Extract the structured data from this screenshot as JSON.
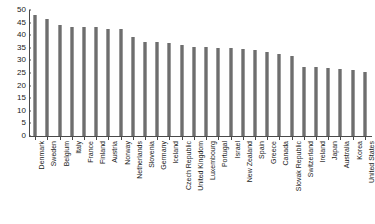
{
  "chart_data": {
    "type": "bar",
    "title": "",
    "subtitle": "",
    "xlabel": "",
    "ylabel": "",
    "ylim": [
      0,
      50
    ],
    "yticks": [
      0,
      5,
      10,
      15,
      20,
      25,
      30,
      35,
      40,
      45,
      50
    ],
    "grid": false,
    "legend": null,
    "bar_color": "#6e6e6e",
    "axis_color": "#4a4a4a",
    "categories": [
      "Denmark",
      "Sweden",
      "Belgium",
      "Italy",
      "France",
      "Finland",
      "Austria",
      "Norway",
      "Netherlands",
      "Slovenia",
      "Germany",
      "Iceland",
      "Czech Republic",
      "United Kingdom",
      "Luxembourg",
      "Portugal",
      "Israel",
      "New Zealand",
      "Spain",
      "Greece",
      "Canada",
      "Slovak Republic",
      "Switzerland",
      "Ireland",
      "Japan",
      "Australia",
      "Korea",
      "United States"
    ],
    "values": [
      48.0,
      46.5,
      44.0,
      43.2,
      43.2,
      43.2,
      42.6,
      42.6,
      39.1,
      37.2,
      37.2,
      37.1,
      36.2,
      35.5,
      35.2,
      35.0,
      34.8,
      34.5,
      34.3,
      33.5,
      32.5,
      31.8,
      27.5,
      27.2,
      27.0,
      26.6,
      26.2,
      25.6
    ]
  }
}
